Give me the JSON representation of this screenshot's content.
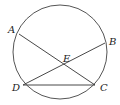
{
  "diagram": {
    "type": "circle-geometry",
    "circle": {
      "cx": 60,
      "cy": 52,
      "r": 47,
      "stroke": "#555555"
    },
    "points": [
      {
        "id": "A",
        "label": "A",
        "x": 19,
        "y": 34,
        "lx": 8,
        "ly": 33
      },
      {
        "id": "B",
        "label": "B",
        "x": 105,
        "y": 43,
        "lx": 109,
        "ly": 45
      },
      {
        "id": "C",
        "label": "C",
        "x": 95,
        "y": 85,
        "lx": 100,
        "ly": 91
      },
      {
        "id": "D",
        "label": "D",
        "x": 23,
        "y": 85,
        "lx": 12,
        "ly": 91
      },
      {
        "id": "E",
        "label": "E",
        "x": 67,
        "y": 67,
        "lx": 63,
        "ly": 62
      }
    ],
    "segments": [
      {
        "from": "A",
        "to": "C"
      },
      {
        "from": "B",
        "to": "D"
      },
      {
        "from": "D",
        "to": "C"
      }
    ],
    "line_color": "#333333"
  }
}
